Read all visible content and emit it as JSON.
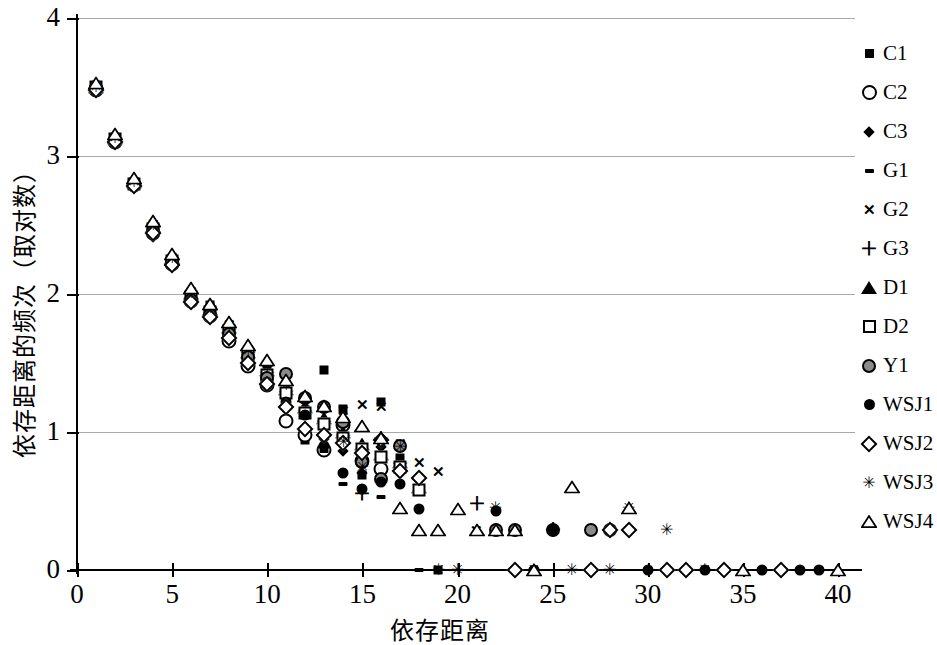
{
  "chart_data": {
    "type": "scatter",
    "title": "",
    "xlabel": "依存距离",
    "ylabel": "依存距离的频次（取对数）",
    "xlim": [
      0,
      40
    ],
    "ylim": [
      0,
      4
    ],
    "xticks": [
      0,
      5,
      10,
      15,
      20,
      25,
      30,
      35,
      40
    ],
    "yticks": [
      0,
      1,
      2,
      3,
      4
    ],
    "grid": "horizontal",
    "legend_position": "right",
    "series": [
      {
        "name": "C1",
        "marker": "filled-square",
        "x": [
          1,
          2,
          3,
          4,
          5,
          6,
          7,
          8,
          9,
          10,
          11,
          12,
          13,
          14,
          15,
          16,
          17,
          19
        ],
        "y": [
          3.5,
          3.12,
          2.8,
          2.48,
          2.25,
          2.0,
          1.92,
          1.75,
          1.55,
          1.44,
          1.24,
          0.94,
          1.45,
          1.17,
          0.69,
          1.22,
          0.81,
          0.0
        ]
      },
      {
        "name": "C2",
        "marker": "open-circle",
        "x": [
          1,
          2,
          3,
          4,
          5,
          6,
          7,
          8,
          9,
          10,
          11,
          12,
          13,
          14,
          15,
          16
        ],
        "y": [
          3.48,
          3.1,
          2.79,
          2.44,
          2.22,
          1.95,
          1.84,
          1.66,
          1.48,
          1.34,
          1.08,
          0.98,
          0.87,
          1.05,
          0.79,
          0.73
        ]
      },
      {
        "name": "C3",
        "marker": "filled-diamond",
        "x": [
          1,
          2,
          3,
          4,
          5,
          6,
          7,
          8,
          9,
          10,
          11,
          12,
          13,
          14,
          15,
          16,
          17
        ],
        "y": [
          3.48,
          3.11,
          2.78,
          2.41,
          2.21,
          1.94,
          1.86,
          1.7,
          1.5,
          1.38,
          1.26,
          1.15,
          0.95,
          0.86,
          0.7,
          0.89,
          0.74
        ]
      },
      {
        "name": "G1",
        "marker": "dash",
        "x": [
          1,
          2,
          3,
          4,
          5,
          6,
          7,
          8,
          9,
          10,
          11,
          12,
          13,
          14,
          15,
          16,
          18
        ],
        "y": [
          3.49,
          3.12,
          2.8,
          2.47,
          2.24,
          1.97,
          1.88,
          1.72,
          1.52,
          1.4,
          1.2,
          1.1,
          0.86,
          0.62,
          0.78,
          0.53,
          0.0
        ]
      },
      {
        "name": "G2",
        "marker": "x-cross",
        "x": [
          1,
          2,
          3,
          4,
          5,
          6,
          7,
          8,
          9,
          10,
          11,
          12,
          13,
          14,
          15,
          16,
          17,
          18,
          19,
          21
        ],
        "y": [
          3.5,
          3.14,
          2.82,
          2.51,
          2.27,
          2.02,
          1.9,
          1.78,
          1.6,
          1.46,
          1.32,
          1.2,
          1.18,
          1.16,
          1.2,
          1.19,
          0.92,
          0.78,
          0.72,
          0.29
        ]
      },
      {
        "name": "G3",
        "marker": "plus",
        "x": [
          1,
          2,
          3,
          4,
          5,
          6,
          7,
          8,
          9,
          10,
          11,
          12,
          13,
          14,
          15,
          16,
          17,
          21,
          25
        ],
        "y": [
          3.49,
          3.12,
          2.8,
          2.48,
          2.25,
          1.99,
          1.88,
          1.74,
          1.57,
          1.43,
          1.29,
          1.15,
          1.07,
          0.97,
          0.55,
          0.95,
          0.77,
          0.48,
          0.29
        ]
      },
      {
        "name": "D1",
        "marker": "filled-triangle",
        "x": [
          1,
          2,
          3,
          4,
          5,
          6,
          7,
          8,
          9,
          10,
          11,
          12,
          13,
          14,
          15,
          16,
          17,
          18
        ],
        "y": [
          3.5,
          3.13,
          2.81,
          2.49,
          2.26,
          2.01,
          1.89,
          1.76,
          1.58,
          1.45,
          1.31,
          1.18,
          1.1,
          1.0,
          0.91,
          0.84,
          0.78,
          0.6
        ]
      },
      {
        "name": "D2",
        "marker": "open-square",
        "x": [
          1,
          2,
          3,
          4,
          5,
          6,
          7,
          8,
          9,
          10,
          11,
          12,
          13,
          14,
          15,
          16,
          17,
          18
        ],
        "y": [
          3.5,
          3.12,
          2.8,
          2.47,
          2.24,
          1.98,
          1.87,
          1.73,
          1.56,
          1.41,
          1.28,
          1.14,
          1.06,
          0.96,
          0.88,
          0.82,
          0.75,
          0.58
        ]
      },
      {
        "name": "Y1",
        "marker": "gray-circle",
        "x": [
          1,
          2,
          3,
          4,
          5,
          6,
          7,
          8,
          9,
          10,
          11,
          12,
          13,
          14,
          15,
          16,
          17,
          22,
          23,
          25,
          27,
          28
        ],
        "y": [
          3.49,
          3.11,
          2.79,
          2.46,
          2.23,
          1.96,
          1.85,
          1.71,
          1.54,
          1.39,
          1.42,
          1.25,
          1.18,
          1.07,
          0.78,
          0.66,
          0.9,
          0.29,
          0.29,
          0.29,
          0.29,
          0.29
        ]
      },
      {
        "name": "WSJ1",
        "marker": "filled-circle",
        "x": [
          1,
          2,
          3,
          4,
          5,
          6,
          7,
          8,
          9,
          10,
          11,
          12,
          13,
          14,
          15,
          16,
          17,
          18,
          22,
          24,
          25,
          30,
          33,
          34,
          36,
          38,
          39
        ],
        "y": [
          3.48,
          3.1,
          2.78,
          2.45,
          2.22,
          1.95,
          1.84,
          1.69,
          1.51,
          1.36,
          1.22,
          1.12,
          0.9,
          0.7,
          0.59,
          0.64,
          0.62,
          0.44,
          0.43,
          0.0,
          0.29,
          0.0,
          0.0,
          0.0,
          0.0,
          0.0,
          0.0
        ]
      },
      {
        "name": "WSJ2",
        "marker": "open-diamond",
        "x": [
          1,
          2,
          3,
          4,
          5,
          6,
          7,
          8,
          9,
          10,
          11,
          12,
          13,
          14,
          15,
          16,
          17,
          18,
          23,
          27,
          28,
          29,
          31,
          32,
          34,
          37
        ],
        "y": [
          3.48,
          3.1,
          2.78,
          2.44,
          2.21,
          1.94,
          1.83,
          1.68,
          1.5,
          1.35,
          1.18,
          1.02,
          0.98,
          0.92,
          0.85,
          0.94,
          0.72,
          0.67,
          0.0,
          0.0,
          0.29,
          0.29,
          0.0,
          0.0,
          0.0,
          0.0
        ]
      },
      {
        "name": "WSJ3",
        "marker": "asterisk",
        "x": [
          1,
          2,
          3,
          4,
          5,
          6,
          7,
          8,
          9,
          10,
          11,
          12,
          13,
          14,
          15,
          16,
          17,
          19,
          20,
          22,
          24,
          26,
          28,
          29,
          31,
          33
        ],
        "y": [
          3.5,
          3.13,
          2.81,
          2.5,
          2.26,
          2.01,
          1.9,
          1.77,
          1.59,
          1.47,
          1.34,
          1.21,
          1.17,
          0.93,
          0.75,
          0.92,
          0.89,
          0.0,
          0.0,
          0.45,
          0.0,
          0.0,
          0.0,
          0.45,
          0.29,
          0.0
        ]
      },
      {
        "name": "WSJ4",
        "marker": "open-triangle",
        "x": [
          1,
          2,
          3,
          4,
          5,
          6,
          7,
          8,
          9,
          10,
          11,
          12,
          13,
          14,
          15,
          16,
          17,
          18,
          19,
          20,
          21,
          22,
          23,
          24,
          26,
          29,
          35,
          40
        ],
        "y": [
          3.53,
          3.16,
          2.84,
          2.53,
          2.29,
          2.04,
          1.93,
          1.8,
          1.63,
          1.52,
          1.38,
          1.26,
          1.19,
          1.11,
          1.04,
          0.96,
          0.45,
          0.29,
          0.29,
          0.44,
          0.29,
          0.29,
          0.29,
          0.0,
          0.6,
          0.45,
          0.0,
          0.0
        ]
      }
    ]
  },
  "legend": {
    "items": [
      {
        "label": "C1",
        "marker": "filled-square"
      },
      {
        "label": "C2",
        "marker": "open-circle"
      },
      {
        "label": "C3",
        "marker": "filled-diamond"
      },
      {
        "label": "G1",
        "marker": "dash"
      },
      {
        "label": "G2",
        "marker": "x-cross"
      },
      {
        "label": "G3",
        "marker": "plus"
      },
      {
        "label": "D1",
        "marker": "filled-triangle"
      },
      {
        "label": "D2",
        "marker": "open-square"
      },
      {
        "label": "Y1",
        "marker": "gray-circle"
      },
      {
        "label": "WSJ1",
        "marker": "filled-circle"
      },
      {
        "label": "WSJ2",
        "marker": "open-diamond"
      },
      {
        "label": "WSJ3",
        "marker": "asterisk"
      },
      {
        "label": "WSJ4",
        "marker": "open-triangle"
      }
    ]
  },
  "colors": {
    "axis": "#000000",
    "gridline": "#a9a9a9",
    "marker_fill": "#000000",
    "marker_gray": "#8a8a8a",
    "background": "#ffffff"
  }
}
